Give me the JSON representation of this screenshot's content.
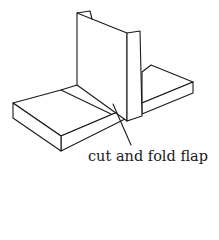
{
  "diagram": {
    "annotation": {
      "label": "cut and fold flap"
    },
    "colors": {
      "ink": "#1a1a1a",
      "background": "#ffffff"
    }
  }
}
